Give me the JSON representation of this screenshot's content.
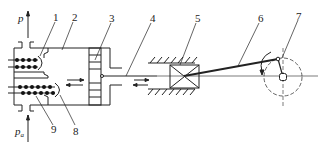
{
  "diagram": {
    "pressure_labels": {
      "top": "p",
      "bottom": "p",
      "bottom_subscript": "a"
    },
    "part_labels": [
      {
        "id": "1",
        "text": "1"
      },
      {
        "id": "2",
        "text": "2"
      },
      {
        "id": "3",
        "text": "3"
      },
      {
        "id": "4",
        "text": "4"
      },
      {
        "id": "5",
        "text": "5"
      },
      {
        "id": "6",
        "text": "6"
      },
      {
        "id": "7",
        "text": "7"
      },
      {
        "id": "8",
        "text": "8"
      },
      {
        "id": "9",
        "text": "9"
      }
    ],
    "colors": {
      "line": "#222222",
      "background": "#ffffff"
    }
  }
}
